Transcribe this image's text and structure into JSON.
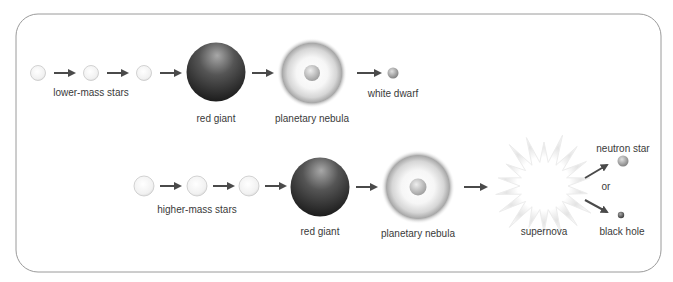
{
  "diagram": {
    "colors": {
      "border": "#9a9a9a",
      "arrow": "#4a4a4a",
      "text": "#3a3a3a",
      "giant_dark": "#1e1e1e",
      "giant_light": "#9c9c9c",
      "nebula_edge": "#8c8c8c",
      "supernova": "#e2e2e2"
    },
    "rows": [
      {
        "id": "low-mass",
        "stages": [
          {
            "key": "main-sequence",
            "label": "lower-mass stars"
          },
          {
            "key": "red-giant",
            "label": "red giant"
          },
          {
            "key": "planetary-nebula",
            "label": "planetary nebula"
          },
          {
            "key": "white-dwarf",
            "label": "white dwarf"
          }
        ]
      },
      {
        "id": "high-mass",
        "stages": [
          {
            "key": "main-sequence",
            "label": "higher-mass stars"
          },
          {
            "key": "red-giant",
            "label": "red giant"
          },
          {
            "key": "planetary-nebula",
            "label": "planetary nebula"
          },
          {
            "key": "supernova",
            "label": "supernova"
          }
        ],
        "outcomes": [
          {
            "key": "neutron-star",
            "label": "neutron star"
          },
          {
            "key": "black-hole",
            "label": "black hole"
          }
        ],
        "separator": "or"
      }
    ]
  }
}
